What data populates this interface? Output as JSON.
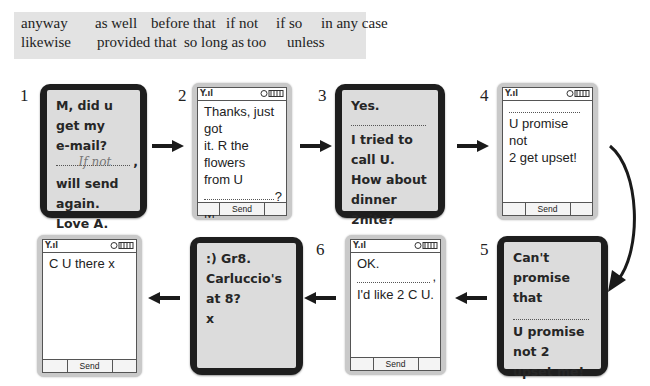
{
  "word_box": {
    "row1": [
      "anyway",
      "as well",
      "before that",
      "if not",
      "if so",
      "in any case"
    ],
    "row2": [
      "likewise",
      "provided that",
      "so long as",
      "too",
      "unless"
    ]
  },
  "messages": [
    {
      "number": "1",
      "style": "dark",
      "lines": [
        "M, did u get my",
        "e-mail?"
      ],
      "blank_answer": "If not",
      "blank_punct": ",",
      "after": [
        "will send again.",
        "Love A."
      ]
    },
    {
      "number": "2",
      "style": "light",
      "lines": [
        "Thanks, just got",
        "it. R the flowers",
        "from U"
      ],
      "blank_punct": "?",
      "after": [
        "M"
      ],
      "send_label": "Send"
    },
    {
      "number": "3",
      "style": "dark",
      "lines": [
        "Yes."
      ],
      "after": [
        "I tried to call U.",
        "How about",
        "dinner 2nite?"
      ]
    },
    {
      "number": "4",
      "style": "light",
      "lines": [],
      "after": [
        "U promise not",
        "2 get upset!"
      ],
      "send_label": "Send"
    },
    {
      "number": "5",
      "style": "dark",
      "lines": [
        "Can't promise",
        "that"
      ],
      "after": [
        "U promise not 2",
        "upset me!"
      ]
    },
    {
      "number": "",
      "style": "light",
      "lines": [
        "OK."
      ],
      "blank_punct": ",",
      "after": [
        "I'd like 2 C U."
      ],
      "send_label": "Send"
    },
    {
      "number": "6",
      "style": "dark",
      "lines": [
        ":) Gr8.",
        "Carluccio's at 8?",
        "x"
      ]
    },
    {
      "number": "",
      "style": "light",
      "lines": [
        "C U there x"
      ],
      "send_label": "Send"
    }
  ],
  "icons": {
    "signal": "signal-icon",
    "battery": "battery-icon",
    "arrow": "arrow-icon"
  }
}
